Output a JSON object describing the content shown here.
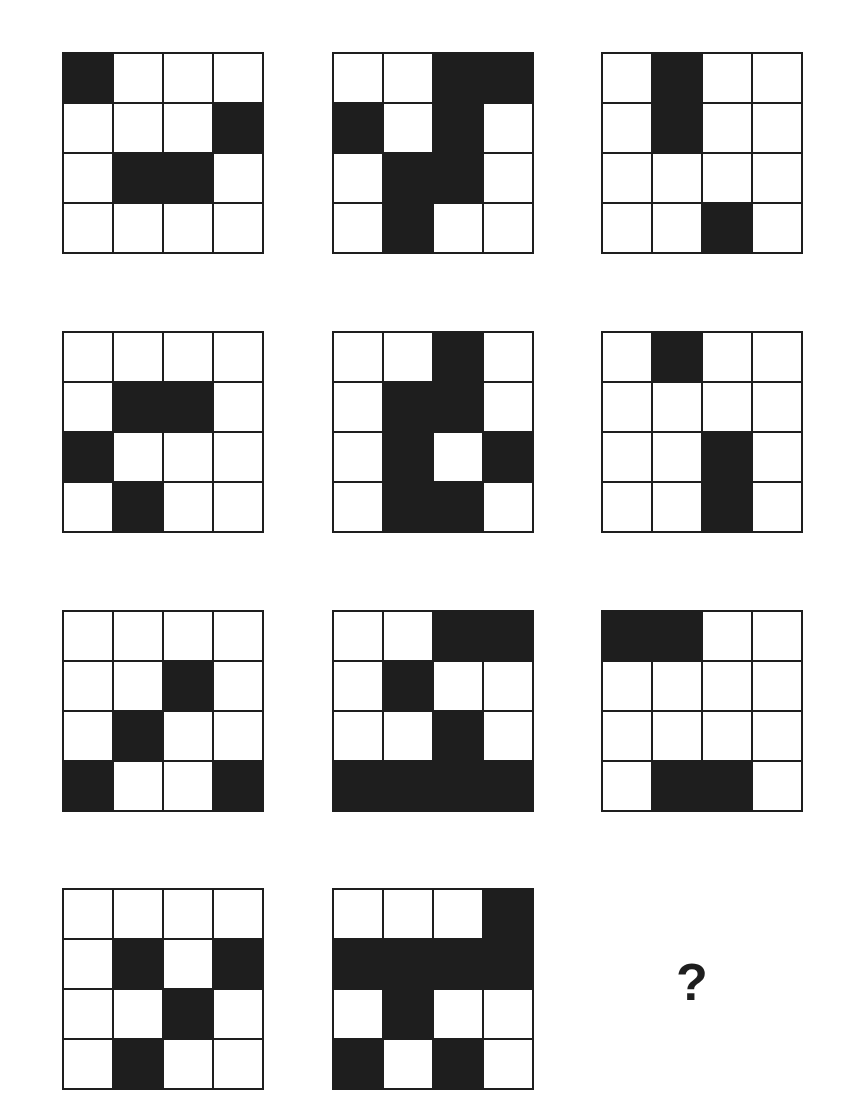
{
  "puzzle": {
    "grid_size": 4,
    "colors": {
      "filled": "#1e1e1e",
      "empty": "#ffffff",
      "border": "#1e1e1e"
    },
    "panels": [
      {
        "id": 1,
        "row": 0,
        "col": 0,
        "cells": [
          [
            1,
            0,
            0,
            0
          ],
          [
            0,
            0,
            0,
            1
          ],
          [
            0,
            1,
            1,
            0
          ],
          [
            0,
            0,
            0,
            0
          ]
        ]
      },
      {
        "id": 2,
        "row": 0,
        "col": 1,
        "cells": [
          [
            0,
            0,
            1,
            1
          ],
          [
            1,
            0,
            1,
            0
          ],
          [
            0,
            1,
            1,
            0
          ],
          [
            0,
            1,
            0,
            0
          ]
        ]
      },
      {
        "id": 3,
        "row": 0,
        "col": 2,
        "cells": [
          [
            0,
            1,
            0,
            0
          ],
          [
            0,
            1,
            0,
            0
          ],
          [
            0,
            0,
            0,
            0
          ],
          [
            0,
            0,
            1,
            0
          ]
        ]
      },
      {
        "id": 4,
        "row": 1,
        "col": 0,
        "cells": [
          [
            0,
            0,
            0,
            0
          ],
          [
            0,
            1,
            1,
            0
          ],
          [
            1,
            0,
            0,
            0
          ],
          [
            0,
            1,
            0,
            0
          ]
        ]
      },
      {
        "id": 5,
        "row": 1,
        "col": 1,
        "cells": [
          [
            0,
            0,
            1,
            0
          ],
          [
            0,
            1,
            1,
            0
          ],
          [
            0,
            1,
            0,
            1
          ],
          [
            0,
            1,
            1,
            0
          ]
        ]
      },
      {
        "id": 6,
        "row": 1,
        "col": 2,
        "cells": [
          [
            0,
            1,
            0,
            0
          ],
          [
            0,
            0,
            0,
            0
          ],
          [
            0,
            0,
            1,
            0
          ],
          [
            0,
            0,
            1,
            0
          ]
        ]
      },
      {
        "id": 7,
        "row": 2,
        "col": 0,
        "cells": [
          [
            0,
            0,
            0,
            0
          ],
          [
            0,
            0,
            1,
            0
          ],
          [
            0,
            1,
            0,
            0
          ],
          [
            1,
            0,
            0,
            1
          ]
        ]
      },
      {
        "id": 8,
        "row": 2,
        "col": 1,
        "cells": [
          [
            0,
            0,
            1,
            1
          ],
          [
            0,
            1,
            0,
            0
          ],
          [
            0,
            0,
            1,
            0
          ],
          [
            1,
            1,
            1,
            1
          ]
        ]
      },
      {
        "id": 9,
        "row": 2,
        "col": 2,
        "cells": [
          [
            1,
            1,
            0,
            0
          ],
          [
            0,
            0,
            0,
            0
          ],
          [
            0,
            0,
            0,
            0
          ],
          [
            0,
            1,
            1,
            0
          ]
        ]
      },
      {
        "id": 10,
        "row": 3,
        "col": 0,
        "cells": [
          [
            0,
            0,
            0,
            0
          ],
          [
            0,
            1,
            0,
            1
          ],
          [
            0,
            0,
            1,
            0
          ],
          [
            0,
            1,
            0,
            0
          ]
        ]
      },
      {
        "id": 11,
        "row": 3,
        "col": 1,
        "cells": [
          [
            0,
            0,
            0,
            1
          ],
          [
            1,
            1,
            1,
            1
          ],
          [
            0,
            1,
            0,
            0
          ],
          [
            1,
            0,
            1,
            0
          ]
        ]
      }
    ],
    "missing_panel": {
      "row": 3,
      "col": 2,
      "label": "?"
    }
  }
}
